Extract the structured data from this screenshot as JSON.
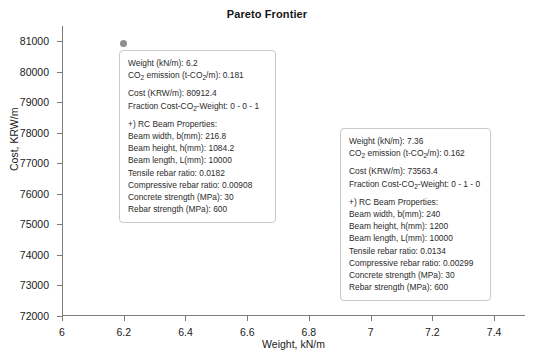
{
  "chart_data": {
    "type": "scatter",
    "title": "Pareto Frontier",
    "xlabel": "Weight, kN/m",
    "ylabel": "Cost, KRW/m",
    "xlim": [
      6,
      7.5
    ],
    "ylim": [
      72000,
      81500
    ],
    "grid": false,
    "legend": "none",
    "xticks": [
      "6",
      "6.2",
      "6.4",
      "6.6",
      "6.8",
      "7",
      "7.2",
      "7.4"
    ],
    "xtick_values": [
      6,
      6.2,
      6.4,
      6.6,
      6.8,
      7,
      7.2,
      7.4
    ],
    "yticks": [
      "72000",
      "73000",
      "74000",
      "75000",
      "76000",
      "77000",
      "78000",
      "79000",
      "80000",
      "81000"
    ],
    "ytick_values": [
      72000,
      73000,
      74000,
      75000,
      76000,
      77000,
      78000,
      79000,
      80000,
      81000
    ],
    "marker_color": "#8f8f8f",
    "points": [
      {
        "x": 6.2,
        "y": 80912.4
      },
      {
        "x": 7.36,
        "y": 73563.4
      }
    ]
  },
  "annotations": [
    {
      "name": "callout-point-1",
      "weight_label": "Weight (kN/m): 6.2",
      "co2_prefix": "CO",
      "co2_sub": "2",
      "co2_mid": " emission (t-CO",
      "co2_sub2": "2",
      "co2_suffix": "/m): 0.181",
      "cost_label": "Cost (KRW/m): 80912.4",
      "fraction_prefix": "Fraction Cost-CO",
      "fraction_sub": "2",
      "fraction_suffix": "-Weight: 0 - 0 - 1",
      "section_header": "+) RC Beam Properties:",
      "props": [
        "Beam width, b(mm): 216.8",
        "Beam height, h(mm): 1084.2",
        "Beam length, L(mm): 10000",
        "Tensile rebar ratio: 0.0182",
        "Compressive rebar ratio: 0.00908",
        "Concrete strength (MPa): 30",
        "Rebar strength (MPa): 600"
      ]
    },
    {
      "name": "callout-point-2",
      "weight_label": "Weight (kN/m): 7.36",
      "co2_prefix": "CO",
      "co2_sub": "2",
      "co2_mid": " emission (t-CO",
      "co2_sub2": "2",
      "co2_suffix": "/m): 0.162",
      "cost_label": "Cost (KRW/m): 73563.4",
      "fraction_prefix": "Fraction Cost-CO",
      "fraction_sub": "2",
      "fraction_suffix": "-Weight: 0 - 1 - 0",
      "section_header": "+) RC Beam Properties:",
      "props": [
        "Beam width, b(mm): 240",
        "Beam height, h(mm): 1200",
        "Beam length, L(mm): 10000",
        "Tensile rebar ratio: 0.0134",
        "Compressive rebar ratio: 0.00299",
        "Concrete strength (MPa): 30",
        "Rebar strength (MPa): 600"
      ]
    }
  ]
}
